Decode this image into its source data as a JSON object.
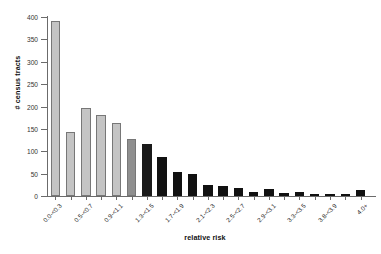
{
  "chart_data": {
    "type": "bar",
    "title": "",
    "xlabel": "relative risk",
    "ylabel": "# census tracts",
    "ylim": [
      0,
      400
    ],
    "ytick_labels": [
      "0",
      "50",
      "100",
      "150",
      "200",
      "250",
      "300",
      "350",
      "400"
    ],
    "ytick_values": [
      0,
      50,
      100,
      150,
      200,
      250,
      300,
      350,
      400
    ],
    "grid": false,
    "legend": null,
    "categories": [
      "0.0-<0.3",
      "0.3-<0.5",
      "0.5-<0.7",
      "0.7-<0.9",
      "0.9-<1.1",
      "1.1-<1.3",
      "1.3-<1.5",
      "1.5-<1.7",
      "1.7-<1.9",
      "1.9-<2.1",
      "2.1-<2.3",
      "2.3-<2.5",
      "2.5-<2.7",
      "2.7-<2.9",
      "2.9-<3.1",
      "3.1-<3.3",
      "3.3-<3.5",
      "3.5-<3.7",
      "3.8-<3.9",
      "3.9-<4.0",
      "4.0+"
    ],
    "xtick_labels_shown": [
      "0.0-<0.3",
      "",
      "0.5-<0.7",
      "",
      "0.9-<1.1",
      "",
      "1.3-<1.5",
      "",
      "1.7-<1.9",
      "",
      "2.1-<2.3",
      "",
      "2.5-<2.7",
      "",
      "2.9-<3.1",
      "",
      "3.3-<3.5",
      "",
      "3.8-<3.9",
      "",
      "4.0+"
    ],
    "values": [
      390,
      142,
      197,
      181,
      164,
      128,
      116,
      87,
      53,
      50,
      25,
      22,
      19,
      9,
      16,
      6,
      10,
      5,
      1,
      0,
      13
    ],
    "bar_colors": [
      "#c4c4c4",
      "#c4c4c4",
      "#c4c4c4",
      "#c4c4c4",
      "#c4c4c4",
      "#8f8f8f",
      "#1a1a1a",
      "#111111",
      "#111111",
      "#111111",
      "#111111",
      "#111111",
      "#111111",
      "#111111",
      "#111111",
      "#111111",
      "#111111",
      "#111111",
      "#111111",
      "#111111",
      "#111111"
    ],
    "axis_color": "#6b6b6b",
    "background": "#ffffff"
  }
}
